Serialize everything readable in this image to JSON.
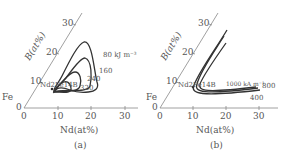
{
  "panels": [
    {
      "id": "a",
      "caption": "(a)",
      "x_axis_label": "Nd(at%)",
      "y_axis_label": "B(at%)",
      "x_ticks": [
        "0",
        "10",
        "20",
        "30"
      ],
      "y_ticks": [
        "10",
        "20",
        "30"
      ],
      "corner_label": "Fe",
      "origin_label": "0",
      "compound_label": "Nd2Fe14B",
      "contour_labels": [
        "80 kJ m⁻³",
        "160",
        "240",
        "320"
      ]
    },
    {
      "id": "b",
      "caption": "(b)",
      "x_axis_label": "Nd(at%)",
      "y_axis_label": "B(at%)",
      "x_ticks": [
        "0",
        "10",
        "20",
        "30"
      ],
      "y_ticks": [
        "10",
        "20",
        "30"
      ],
      "corner_label": "Fe",
      "origin_label": "0",
      "compound_label": "Nd2Fe14B",
      "contour_labels": [
        "1000 kA m⁻¹",
        "800",
        "400"
      ]
    }
  ],
  "colors": {
    "line": "#333333",
    "axis": "#888888",
    "text": "#555555"
  }
}
